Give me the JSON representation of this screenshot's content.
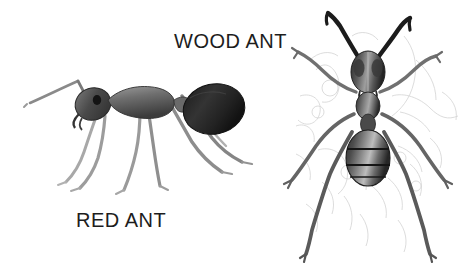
{
  "image": {
    "title": "Ant species comparison illustration",
    "background_color": "#ffffff",
    "width": 475,
    "height": 266,
    "style": "pencil / engraving sketch, grayscale"
  },
  "labels": {
    "wood_ant": "WOOD ANT",
    "red_ant": "RED ANT"
  },
  "specimens": [
    {
      "name": "red-ant",
      "label": "RED ANT",
      "view": "lateral side view",
      "facing": "left",
      "position": "left half of image",
      "parts": [
        "antenna",
        "head",
        "eye",
        "mandible",
        "thorax",
        "petiole",
        "gaster",
        "legs"
      ],
      "leg_count": 6,
      "colors": {
        "gaster": "#2b2b2b",
        "head": "#4a4a4a",
        "thorax": "#6e6e6e",
        "legs": "#9a9a9a"
      }
    },
    {
      "name": "wood-ant",
      "label": "WOOD ANT",
      "view": "dorsal top view",
      "facing": "up",
      "position": "right side of image",
      "parts": [
        "antennae",
        "head",
        "compound eyes",
        "thorax",
        "petiole",
        "gaster",
        "legs",
        "background sketch"
      ],
      "leg_count": 6,
      "colors": {
        "antennae": "#1f1f1f",
        "head": "#3d3d3d",
        "gaster": "#3a3a3a",
        "legs": "#6b6b6b",
        "background_sketch": "#cfcfcf"
      }
    }
  ],
  "colors": {
    "text": "#1d1d1d",
    "background": "#ffffff",
    "ink_dark": "#2b2b2b",
    "ink_mid": "#6e6e6e",
    "ink_light": "#b5b5b5"
  }
}
